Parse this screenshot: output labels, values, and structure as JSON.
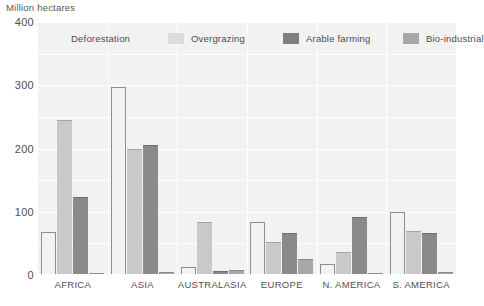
{
  "chart_data": {
    "type": "bar",
    "title": "",
    "ylabel": "Million hectares",
    "xlabel": "",
    "ylim": [
      0,
      400
    ],
    "yticks": [
      0,
      100,
      200,
      300,
      400
    ],
    "grid": true,
    "legend_position": "top",
    "categories": [
      "AFRICA",
      "ASIA",
      "AUSTRALASIA",
      "EUROPE",
      "N. AMERICA",
      "S. AMERICA"
    ],
    "series": [
      {
        "name": "Deforestation",
        "color": "#f2f2f2",
        "values": [
          68,
          298,
          12,
          84,
          18,
          100
        ]
      },
      {
        "name": "Overgrazing",
        "color": "#c9c9c9",
        "values": [
          243,
          197,
          83,
          50,
          35,
          68
        ]
      },
      {
        "name": "Arable farming",
        "color": "#8a8a8a",
        "values": [
          121,
          204,
          5,
          65,
          90,
          65
        ]
      },
      {
        "name": "Bio-industrial",
        "color": "#a8a8a8",
        "values": [
          2,
          3,
          7,
          23,
          2,
          3
        ]
      }
    ]
  },
  "axis": {
    "y_title": "Million hectares",
    "tick_400": "400",
    "tick_300": "300",
    "tick_200": "200",
    "tick_100": "100",
    "tick_0": "0"
  },
  "legend": {
    "items": [
      {
        "label": "Deforestation",
        "color": "#f2f2f2"
      },
      {
        "label": "Overgrazing",
        "color": "#dcdcdc"
      },
      {
        "label": "Arable farming",
        "color": "#808080"
      },
      {
        "label": "Bio-industrial",
        "color": "#a8a8a8"
      }
    ]
  },
  "colors": {
    "plot_background": "#f2f2f2",
    "gridline": "#ffffff",
    "text": "#4f4f52",
    "bar_outline": "#8d8d90"
  }
}
